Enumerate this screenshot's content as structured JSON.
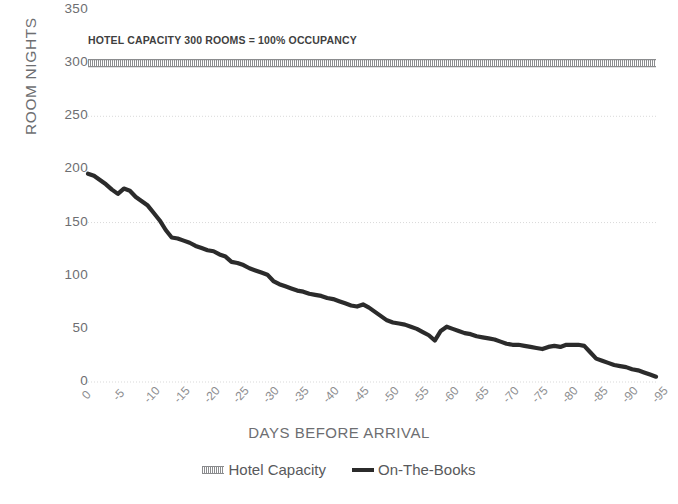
{
  "chart_data": {
    "type": "line",
    "title": "",
    "annotation": "HOTEL CAPACITY 300 ROOMS = 100% OCCUPANCY",
    "xlabel": "DAYS BEFORE ARRIVAL",
    "ylabel": "ROOM NIGHTS",
    "ylim": [
      0,
      350
    ],
    "xlim": [
      0,
      -95
    ],
    "y_ticks": [
      350,
      300,
      250,
      200,
      150,
      100,
      50,
      0
    ],
    "x_ticks": [
      "0",
      "-5",
      "-10",
      "-15",
      "-20",
      "-25",
      "-30",
      "-35",
      "-40",
      "-45",
      "-50",
      "-55",
      "-60",
      "-65",
      "-70",
      "-75",
      "-80",
      "-85",
      "-90",
      "-95"
    ],
    "grid": "horizontal-dotted",
    "legend_position": "bottom",
    "colors": {
      "capacity_line": "#8b8c8e",
      "books_line": "#2b2b2b",
      "axis_text": "#6d6e71",
      "gridline": "#d9d9d9",
      "background": "#ffffff"
    },
    "series": [
      {
        "name": "Hotel Capacity",
        "style": "hatched-thick",
        "constant_value": 300,
        "x": [
          0,
          -95
        ],
        "values": [
          300,
          300
        ]
      },
      {
        "name": "On-The-Books",
        "style": "solid-thick",
        "x": [
          0,
          -1,
          -2,
          -3,
          -4,
          -5,
          -6,
          -7,
          -8,
          -9,
          -10,
          -11,
          -12,
          -13,
          -14,
          -15,
          -16,
          -17,
          -18,
          -19,
          -20,
          -21,
          -22,
          -23,
          -24,
          -25,
          -26,
          -27,
          -28,
          -29,
          -30,
          -31,
          -32,
          -33,
          -34,
          -35,
          -36,
          -37,
          -38,
          -39,
          -40,
          -41,
          -42,
          -43,
          -44,
          -45,
          -46,
          -47,
          -48,
          -49,
          -50,
          -51,
          -52,
          -53,
          -54,
          -55,
          -56,
          -57,
          -58,
          -59,
          -60,
          -61,
          -62,
          -63,
          -64,
          -65,
          -66,
          -67,
          -68,
          -69,
          -70,
          -71,
          -72,
          -73,
          -74,
          -75,
          -76,
          -77,
          -78,
          -79,
          -80,
          -81,
          -82,
          -83,
          -84,
          -85,
          -86,
          -87,
          -88,
          -89,
          -90,
          -91,
          -92,
          -93,
          -94,
          -95
        ],
        "values": [
          196,
          194,
          190,
          186,
          181,
          177,
          182,
          180,
          174,
          170,
          166,
          159,
          152,
          143,
          136,
          135,
          133,
          131,
          128,
          126,
          124,
          123,
          120,
          118,
          113,
          112,
          110,
          107,
          105,
          103,
          101,
          95,
          92,
          90,
          88,
          86,
          85,
          83,
          82,
          81,
          79,
          78,
          76,
          74,
          72,
          71,
          73,
          70,
          66,
          62,
          58,
          56,
          55,
          54,
          52,
          50,
          47,
          44,
          39,
          48,
          52,
          50,
          48,
          46,
          45,
          43,
          42,
          41,
          40,
          38,
          36,
          35,
          35,
          34,
          33,
          32,
          31,
          33,
          34,
          33,
          35,
          35,
          35,
          34,
          28,
          22,
          20,
          18,
          16,
          15,
          14,
          12,
          11,
          9,
          7,
          5
        ]
      }
    ]
  }
}
